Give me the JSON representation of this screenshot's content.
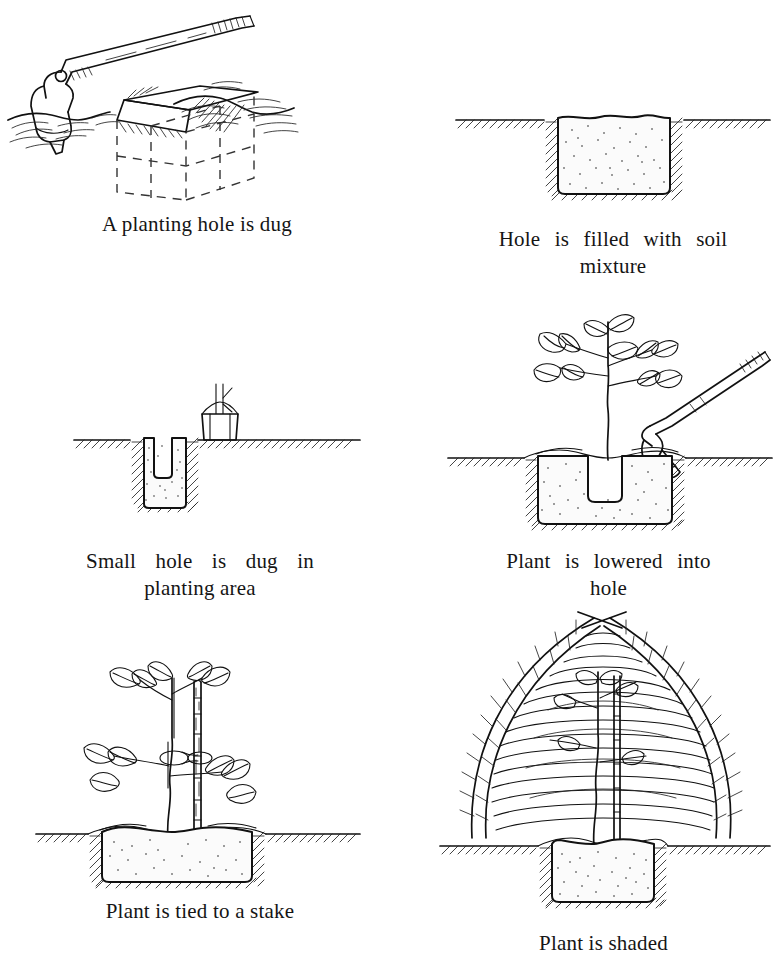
{
  "document": {
    "title": "Tree planting step sequence",
    "background_color": "#ffffff",
    "ink_color": "#111111",
    "panel_count": 6
  },
  "panels": [
    {
      "id": "planting-hole-dug",
      "step": 1,
      "caption_lines": [
        "A planting hole is dug"
      ],
      "scene_elements": [
        "hoe",
        "ground-surface",
        "open-pit",
        "dashed-pit-outline"
      ],
      "illustration_name": "hoe-digging-hole"
    },
    {
      "id": "hole-filled-soil",
      "step": 2,
      "caption_lines": [
        "Hole is filled with soil",
        "mixture"
      ],
      "scene_elements": [
        "ground-line",
        "pit-cross-section",
        "soil-mixture-fill"
      ],
      "illustration_name": "filled-hole-cross-section"
    },
    {
      "id": "small-hole-dug",
      "step": 3,
      "caption_lines": [
        "Small hole is dug in",
        "planting area"
      ],
      "scene_elements": [
        "ground-line",
        "pit-cross-section",
        "soil-mixture-fill",
        "small-notch-hole",
        "seedling-container"
      ],
      "illustration_name": "small-hole-in-planting-area"
    },
    {
      "id": "plant-lowered",
      "step": 4,
      "caption_lines": [
        "Plant is lowered into",
        "hole"
      ],
      "scene_elements": [
        "sapling",
        "ground-line",
        "pit-cross-section",
        "soil-mixture-fill",
        "root-ball-cavity",
        "hoe"
      ],
      "illustration_name": "plant-lowered-into-hole"
    },
    {
      "id": "plant-tied-stake",
      "step": 5,
      "caption_lines": [
        "Plant is tied to a stake"
      ],
      "scene_elements": [
        "sapling",
        "bamboo-stake",
        "tie-loop",
        "ground-line",
        "pit-cross-section",
        "soil-mixture-fill"
      ],
      "illustration_name": "plant-tied-to-stake"
    },
    {
      "id": "plant-shaded",
      "step": 6,
      "caption_lines": [
        "Plant is shaded"
      ],
      "scene_elements": [
        "woven-frond-dome",
        "sapling",
        "ground-line",
        "pit-cross-section",
        "soil-mixture-fill"
      ],
      "illustration_name": "plant-shaded-by-dome"
    }
  ]
}
